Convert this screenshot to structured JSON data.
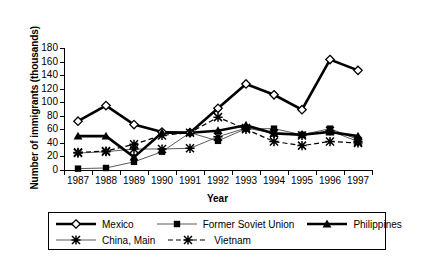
{
  "chart_data": {
    "type": "line",
    "title": "",
    "xlabel": "Year",
    "ylabel": "Number of immigrants (thousands)",
    "categories": [
      "1987",
      "1988",
      "1989",
      "1990",
      "1991",
      "1992",
      "1993",
      "1994",
      "1995",
      "1996",
      "1997"
    ],
    "x": [
      1987,
      1988,
      1989,
      1990,
      1991,
      1992,
      1993,
      1994,
      1995,
      1996,
      1997
    ],
    "ylim": [
      0,
      180
    ],
    "yticks": [
      0,
      20,
      40,
      60,
      80,
      100,
      120,
      140,
      160,
      180
    ],
    "grid": false,
    "legend_position": "bottom",
    "series": [
      {
        "name": "Mexico",
        "marker": "diamond-open",
        "line": "solid-thick",
        "values": [
          72,
          95,
          67,
          56,
          55,
          91,
          127,
          111,
          89,
          163,
          147
        ]
      },
      {
        "name": "Former Soviet Union",
        "marker": "square-filled",
        "line": "solid-thin",
        "values": [
          2,
          3,
          12,
          27,
          55,
          43,
          61,
          61,
          52,
          61,
          45
        ]
      },
      {
        "name": "Philippines",
        "marker": "triangle-filled",
        "line": "solid-thick",
        "values": [
          50,
          50,
          19,
          55,
          55,
          58,
          66,
          54,
          52,
          56,
          50
        ]
      },
      {
        "name": "China, Main",
        "marker": "star-x",
        "line": "solid-thin",
        "values": [
          25,
          27,
          31,
          31,
          32,
          49,
          62,
          54,
          51,
          58,
          42
        ]
      },
      {
        "name": "Vietnam",
        "marker": "star-x",
        "line": "dashed",
        "values": [
          26,
          28,
          38,
          51,
          55,
          78,
          60,
          42,
          36,
          42,
          40
        ]
      }
    ]
  },
  "axes": {
    "y_tick_labels": [
      "180",
      "160",
      "140",
      "120",
      "100",
      "80",
      "60",
      "40",
      "20",
      "0"
    ],
    "x_tick_labels": [
      "1987",
      "1988",
      "1989",
      "1990",
      "1991",
      "1992",
      "1993",
      "1994",
      "1995",
      "1996",
      "1997"
    ],
    "y_axis_title": "Number of immigrants (thousands)",
    "x_axis_title": "Year"
  },
  "legend": {
    "row1": [
      {
        "label": "Mexico",
        "marker": "diamond-open",
        "style": "solid-thick"
      },
      {
        "label": "Former Soviet Union",
        "marker": "square-filled",
        "style": "solid-thin"
      },
      {
        "label": "Philippines",
        "marker": "triangle-filled",
        "style": "solid-thick"
      }
    ],
    "row2": [
      {
        "label": "China, Main",
        "marker": "star-x",
        "style": "solid-thin"
      },
      {
        "label": "Vietnam",
        "marker": "star-x",
        "style": "dashed"
      }
    ]
  },
  "colors": {
    "ink": "#000000",
    "background": "#ffffff",
    "thin_line": "#5a5a5a"
  }
}
